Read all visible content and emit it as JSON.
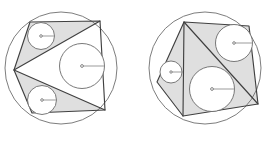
{
  "figure": {
    "background_color": "#ffffff",
    "shade_color": "#d9d9d9",
    "outline_color": "#404040",
    "circle_stroke_color": "#6a6a6a",
    "radius_line_color": "#8a8a8a",
    "canvas": {
      "width": 263,
      "height": 141
    }
  },
  "panels": [
    {
      "id": "left-panel",
      "label": "Left figure",
      "outer_circle": {
        "cx": 61,
        "cy": 68,
        "r": 56
      },
      "quadrilateral": {
        "label": "cyclic quadrilateral ABCD",
        "vertices": [
          {
            "name": "A",
            "x": 14,
            "y": 70
          },
          {
            "name": "B",
            "x": 30,
            "y": 22
          },
          {
            "name": "C",
            "x": 100,
            "y": 21
          },
          {
            "name": "D",
            "x": 105,
            "y": 110
          },
          {
            "name": "E",
            "x": 32,
            "y": 113
          }
        ]
      },
      "diagonals": [
        {
          "name": "diagonal-A-C",
          "from": "A",
          "to": "C"
        },
        {
          "name": "diagonal-A-D",
          "from": "A",
          "to": "D"
        }
      ],
      "shaded_polygons": [
        {
          "name": "shaded-upper",
          "points": "14,70 30,22 100,21"
        },
        {
          "name": "shaded-lower",
          "points": "14,70 105,110 32,113"
        }
      ],
      "incircles": [
        {
          "name": "incircle-upper",
          "cx": 41,
          "cy": 36,
          "r": 13.5,
          "radius_angle_deg": 0
        },
        {
          "name": "incircle-center",
          "cx": 82,
          "cy": 66,
          "r": 22.5,
          "radius_angle_deg": 0
        },
        {
          "name": "incircle-lower",
          "cx": 42,
          "cy": 100,
          "r": 14.5,
          "radius_angle_deg": 0
        }
      ]
    },
    {
      "id": "right-panel",
      "label": "Right figure",
      "outer_circle": {
        "cx": 205,
        "cy": 68,
        "r": 56
      },
      "quadrilateral": {
        "label": "cyclic quadrilateral PQRS",
        "vertices": [
          {
            "name": "P",
            "x": 184,
            "y": 22
          },
          {
            "name": "Q",
            "x": 249,
            "y": 26
          },
          {
            "name": "R",
            "x": 258,
            "y": 104
          },
          {
            "name": "S",
            "x": 183,
            "y": 116
          },
          {
            "name": "T",
            "x": 157,
            "y": 82
          }
        ]
      },
      "diagonals": [
        {
          "name": "diagonal-P-R",
          "from": "P",
          "to": "R"
        },
        {
          "name": "diagonal-P-S",
          "from": "P",
          "to": "S"
        }
      ],
      "shaded_polygons": [
        {
          "name": "shaded-right",
          "points": "184,22 249,26 258,104"
        },
        {
          "name": "shaded-left",
          "points": "184,22 183,116 157,82"
        },
        {
          "name": "shaded-bottom",
          "points": "184,22 258,104 183,116"
        }
      ],
      "incircles": [
        {
          "name": "incircle-top-right",
          "cx": 234,
          "cy": 43,
          "r": 18.5,
          "radius_angle_deg": 0
        },
        {
          "name": "incircle-bottom",
          "cx": 212,
          "cy": 89,
          "r": 22.5,
          "radius_angle_deg": 0
        },
        {
          "name": "incircle-left-small",
          "cx": 171,
          "cy": 72,
          "r": 11,
          "radius_angle_deg": 0
        }
      ]
    }
  ]
}
